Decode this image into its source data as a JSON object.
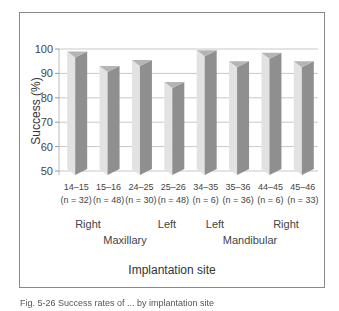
{
  "chart_data": {
    "type": "bar",
    "title": "",
    "xlabel": "Implantation site",
    "ylabel": "Success (%)",
    "ylim": [
      50,
      100
    ],
    "yticks": [
      50,
      60,
      70,
      80,
      90,
      100
    ],
    "grid": true,
    "categories": [
      "14–15",
      "15–16",
      "24–25",
      "25–26",
      "34–35",
      "35–36",
      "44–45",
      "45–46"
    ],
    "sample_sizes": [
      "(n = 32)",
      "(n = 48)",
      "(n = 30)",
      "(n = 48)",
      "(n = 6)",
      "(n = 36)",
      "(n = 6)",
      "(n = 33)"
    ],
    "values": [
      99,
      93,
      95.5,
      86.5,
      99.5,
      95,
      98.5,
      95
    ],
    "side_labels": [
      "Right",
      "Left",
      "Left",
      "Right"
    ],
    "jaw_labels": [
      "Maxillary",
      "Mandibular"
    ]
  },
  "caption": "Fig. 5-26 Success rates of ... by implantation site"
}
